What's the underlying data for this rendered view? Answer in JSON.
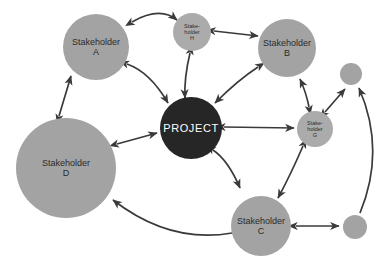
{
  "diagram": {
    "type": "stakeholder-map",
    "title": "",
    "background_color": "#ffffff",
    "colors": {
      "stakeholder_fill": "#a3a3a3",
      "stakeholder_fill_light": "#ababab",
      "project_fill": "#262626",
      "arrow_stroke": "#3a3a3a",
      "label_text": "#2b2b2b",
      "project_text": "#ffffff"
    },
    "nodes": [
      {
        "id": "project",
        "label_line1": "PROJECT",
        "label_line2": "",
        "cx": 191,
        "cy": 128,
        "r": 31,
        "fill": "#262626",
        "text_color": "#ffffff",
        "font_size": 11,
        "letter_spacing": 0.6,
        "kind": "project"
      },
      {
        "id": "stakeholder-a",
        "label_line1": "Stakeholder",
        "label_line2": "A",
        "cx": 96,
        "cy": 47,
        "r": 33,
        "fill": "#a3a3a3",
        "text_color": "#2b2b2b",
        "font_size": 9,
        "kind": "stakeholder"
      },
      {
        "id": "stakeholder-b",
        "label_line1": "Stakeholder",
        "label_line2": "B",
        "cx": 287,
        "cy": 48,
        "r": 29,
        "fill": "#a3a3a3",
        "text_color": "#2b2b2b",
        "font_size": 9,
        "kind": "stakeholder"
      },
      {
        "id": "stakeholder-c",
        "label_line1": "Stakeholder",
        "label_line2": "C",
        "cx": 261,
        "cy": 226,
        "r": 30,
        "fill": "#a3a3a3",
        "text_color": "#2b2b2b",
        "font_size": 9,
        "kind": "stakeholder"
      },
      {
        "id": "stakeholder-d",
        "label_line1": "Stakeholder",
        "label_line2": "D",
        "cx": 66,
        "cy": 168,
        "r": 50,
        "fill": "#a3a3a3",
        "text_color": "#2b2b2b",
        "font_size": 9,
        "kind": "stakeholder"
      },
      {
        "id": "stakeholder-g",
        "label_line1": "Stake-\nholder",
        "label_line2": "G",
        "cx": 315,
        "cy": 129,
        "r": 18,
        "fill": "#ababab",
        "text_color": "#2b2b2b",
        "font_size": 5.5,
        "kind": "stakeholder-small"
      },
      {
        "id": "stakeholder-h",
        "label_line1": "Stake-\nholder",
        "label_line2": "H",
        "cx": 192,
        "cy": 32,
        "r": 19,
        "fill": "#ababab",
        "text_color": "#2b2b2b",
        "font_size": 5.5,
        "kind": "stakeholder-small"
      },
      {
        "id": "small-circle-top-right",
        "label_line1": "",
        "label_line2": "",
        "cx": 351,
        "cy": 74,
        "r": 11,
        "fill": "#a3a3a3",
        "text_color": "#2b2b2b",
        "font_size": 6,
        "kind": "unlabeled"
      },
      {
        "id": "small-circle-bottom-right",
        "label_line1": "",
        "label_line2": "",
        "cx": 355,
        "cy": 227,
        "r": 12,
        "fill": "#a3a3a3",
        "text_color": "#2b2b2b",
        "font_size": 6,
        "kind": "unlabeled"
      }
    ],
    "connections": [
      {
        "id": "conn-a-h",
        "from": "stakeholder-a",
        "to": "stakeholder-h",
        "arrow": "double",
        "style": "curved"
      },
      {
        "id": "conn-h-b",
        "from": "stakeholder-h",
        "to": "stakeholder-b",
        "arrow": "double",
        "style": "straight"
      },
      {
        "id": "conn-a-project",
        "from": "stakeholder-a",
        "to": "project",
        "arrow": "double",
        "style": "curved"
      },
      {
        "id": "conn-h-project",
        "from": "stakeholder-h",
        "to": "project",
        "arrow": "double",
        "style": "curved"
      },
      {
        "id": "conn-b-project",
        "from": "stakeholder-b",
        "to": "project",
        "arrow": "double",
        "style": "curved"
      },
      {
        "id": "conn-d-a",
        "from": "stakeholder-d",
        "to": "stakeholder-a",
        "arrow": "double",
        "style": "straight"
      },
      {
        "id": "conn-d-project",
        "from": "stakeholder-d",
        "to": "project",
        "arrow": "double",
        "style": "straight"
      },
      {
        "id": "conn-project-g",
        "from": "project",
        "to": "stakeholder-g",
        "arrow": "double",
        "style": "straight"
      },
      {
        "id": "conn-project-c",
        "from": "project",
        "to": "stakeholder-c",
        "arrow": "double",
        "style": "curved"
      },
      {
        "id": "conn-g-b",
        "from": "stakeholder-g",
        "to": "stakeholder-b",
        "arrow": "double",
        "style": "curved"
      },
      {
        "id": "conn-g-smalltr",
        "from": "stakeholder-g",
        "to": "small-circle-top-right",
        "arrow": "double",
        "style": "straight"
      },
      {
        "id": "conn-g-c",
        "from": "stakeholder-g",
        "to": "stakeholder-c",
        "arrow": "double",
        "style": "curved"
      },
      {
        "id": "conn-c-d",
        "from": "stakeholder-c",
        "to": "stakeholder-d",
        "arrow": "single",
        "style": "curved"
      },
      {
        "id": "conn-c-smallbr",
        "from": "stakeholder-c",
        "to": "small-circle-bottom-right",
        "arrow": "double",
        "style": "straight"
      },
      {
        "id": "conn-smallbr-smalltr",
        "from": "small-circle-bottom-right",
        "to": "small-circle-top-right",
        "arrow": "single",
        "style": "curved-long"
      }
    ]
  }
}
